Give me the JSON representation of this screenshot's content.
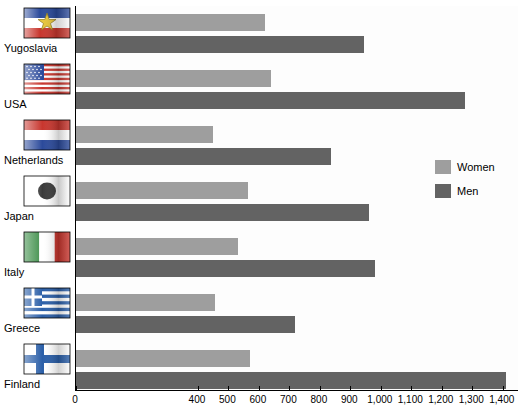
{
  "chart_data": {
    "type": "bar",
    "orientation": "horizontal",
    "title": "",
    "xlabel": "",
    "ylabel": "",
    "categories": [
      "Finland",
      "Greece",
      "Italy",
      "Japan",
      "Netherlands",
      "USA",
      "Yugoslavia"
    ],
    "series": [
      {
        "name": "Women",
        "color": "#9e9e9e",
        "values": [
          570,
          455,
          530,
          565,
          450,
          640,
          620
        ]
      },
      {
        "name": "Men",
        "color": "#636363",
        "values": [
          1410,
          720,
          980,
          960,
          835,
          1275,
          945
        ]
      }
    ],
    "xticks": [
      0,
      400,
      500,
      600,
      700,
      800,
      900,
      1000,
      1100,
      1200,
      1300,
      1400
    ],
    "xtick_labels": [
      "0",
      "400",
      "500",
      "600",
      "700",
      "800",
      "900",
      "1,000",
      "1,100",
      "1,200",
      "1,300",
      "1,400"
    ],
    "xlim": [
      0,
      1450
    ],
    "grid": false,
    "legend_position": "right"
  },
  "legend": {
    "entries": [
      {
        "label": "Women",
        "color": "#9e9e9e"
      },
      {
        "label": "Men",
        "color": "#636363"
      }
    ]
  },
  "axis": {
    "tick_labels": [
      "0",
      "400",
      "500",
      "600",
      "700",
      "800",
      "900",
      "1,000",
      "1,100",
      "1,200",
      "1,300",
      "1,400"
    ]
  },
  "countries": [
    {
      "name": "Yugoslavia",
      "flag": "flag-yugoslavia-icon"
    },
    {
      "name": "USA",
      "flag": "flag-usa-icon"
    },
    {
      "name": "Netherlands",
      "flag": "flag-netherlands-icon"
    },
    {
      "name": "Japan",
      "flag": "flag-japan-icon"
    },
    {
      "name": "Italy",
      "flag": "flag-italy-icon"
    },
    {
      "name": "Greece",
      "flag": "flag-greece-icon"
    },
    {
      "name": "Finland",
      "flag": "flag-finland-icon"
    }
  ]
}
